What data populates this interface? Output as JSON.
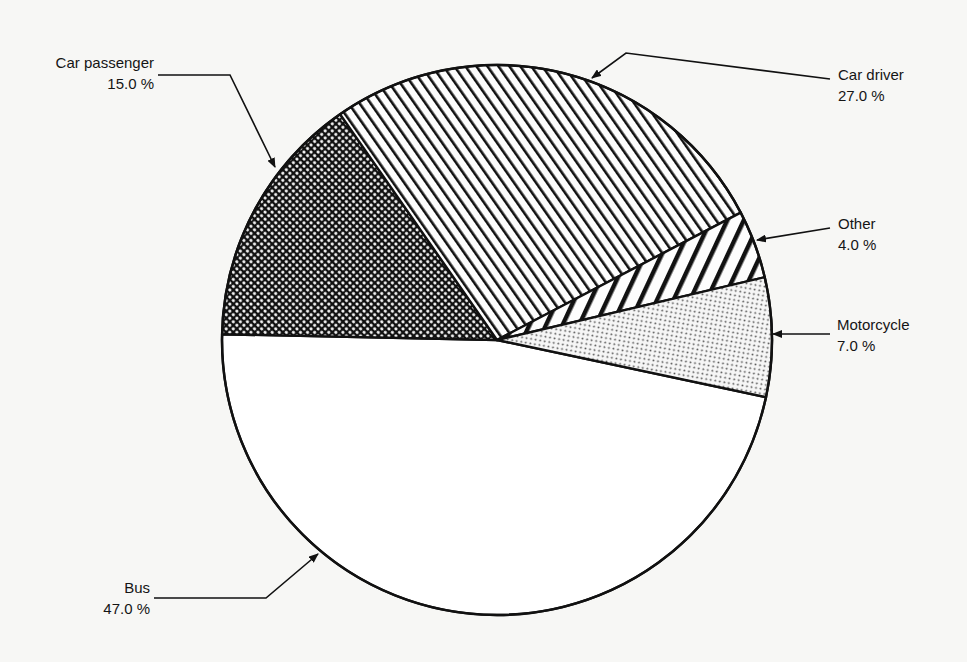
{
  "chart_data": {
    "type": "pie",
    "title": "",
    "categories": [
      "Bus",
      "Car passenger",
      "Car driver",
      "Other",
      "Motorcycle"
    ],
    "values": [
      47.0,
      15.0,
      27.0,
      4.0,
      7.0
    ],
    "unit": "%",
    "labels": [
      {
        "name": "Bus",
        "value_text": "47.0 %",
        "pattern": "blank"
      },
      {
        "name": "Car passenger",
        "value_text": "15.0 %",
        "pattern": "dense-crosshatch"
      },
      {
        "name": "Car driver",
        "value_text": "27.0 %",
        "pattern": "backslash-hatch"
      },
      {
        "name": "Other",
        "value_text": "4.0 %",
        "pattern": "wide-slash-hatch"
      },
      {
        "name": "Motorcycle",
        "value_text": "7.0 %",
        "pattern": "dot-stipple"
      }
    ],
    "legend": "none (callout labels with arrows)",
    "grid": false
  },
  "callouts": {
    "car_passenger": {
      "name": "Car passenger",
      "value": "15.0 %"
    },
    "car_driver": {
      "name": "Car driver",
      "value": "27.0 %"
    },
    "other": {
      "name": "Other",
      "value": "4.0 %"
    },
    "motorcycle": {
      "name": "Motorcycle",
      "value": "7.0 %"
    },
    "bus": {
      "name": "Bus",
      "value": "47.0 %"
    }
  },
  "colors": {
    "ink": "#111111",
    "paper": "#f7f7f5",
    "bus_fill": "#ffffff"
  }
}
